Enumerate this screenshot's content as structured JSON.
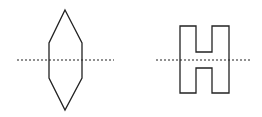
{
  "figure": {
    "shapes": [
      {
        "name": "hexagon",
        "line": "dotted-horizontal"
      },
      {
        "name": "letter-H",
        "line": "dotted-horizontal"
      }
    ],
    "colors": {
      "stroke": "#222222",
      "background": "#ffffff"
    }
  }
}
